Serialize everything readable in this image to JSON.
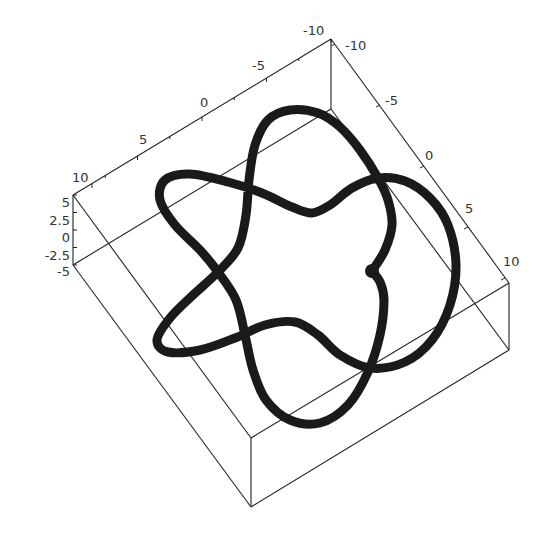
{
  "chart_data": {
    "type": "line",
    "subtype": "3d-parametric-curve",
    "title": "",
    "axes": {
      "x": {
        "range": [
          -10,
          10
        ],
        "ticks": [
          "10",
          "5",
          "0",
          "-5",
          "-10"
        ]
      },
      "y": {
        "range": [
          -10,
          10
        ],
        "ticks": [
          "-10",
          "-5",
          "0",
          "5",
          "10"
        ]
      },
      "z": {
        "range": [
          -5,
          5
        ],
        "ticks": [
          "5",
          "2.5",
          "0",
          "-2.5",
          "-5"
        ]
      }
    },
    "box_grid": false,
    "legend": null,
    "curve_points_2d_projection": [
      [
        372,
        271
      ],
      [
        385,
        250
      ],
      [
        392,
        225
      ],
      [
        388,
        200
      ],
      [
        378,
        178
      ],
      [
        360,
        150
      ],
      [
        340,
        127
      ],
      [
        318,
        113
      ],
      [
        290,
        110
      ],
      [
        268,
        120
      ],
      [
        255,
        145
      ],
      [
        249,
        180
      ],
      [
        246,
        215
      ],
      [
        238,
        248
      ],
      [
        218,
        272
      ],
      [
        193,
        295
      ],
      [
        170,
        318
      ],
      [
        157,
        340
      ],
      [
        168,
        352
      ],
      [
        200,
        350
      ],
      [
        235,
        338
      ],
      [
        265,
        325
      ],
      [
        295,
        322
      ],
      [
        318,
        335
      ],
      [
        340,
        355
      ],
      [
        370,
        368
      ],
      [
        405,
        362
      ],
      [
        432,
        340
      ],
      [
        450,
        305
      ],
      [
        456,
        265
      ],
      [
        448,
        225
      ],
      [
        430,
        198
      ],
      [
        405,
        181
      ],
      [
        378,
        178
      ],
      [
        352,
        188
      ],
      [
        330,
        205
      ],
      [
        312,
        213
      ],
      [
        292,
        207
      ],
      [
        262,
        193
      ],
      [
        228,
        182
      ],
      [
        190,
        174
      ],
      [
        165,
        180
      ],
      [
        160,
        200
      ],
      [
        175,
        225
      ],
      [
        200,
        250
      ],
      [
        218,
        272
      ],
      [
        236,
        300
      ],
      [
        245,
        335
      ],
      [
        253,
        370
      ],
      [
        266,
        400
      ],
      [
        290,
        420
      ],
      [
        320,
        423
      ],
      [
        348,
        405
      ],
      [
        368,
        372
      ],
      [
        380,
        335
      ],
      [
        384,
        300
      ],
      [
        380,
        282
      ],
      [
        372,
        271
      ]
    ],
    "endpoint_marker": [
      372,
      271
    ]
  },
  "plot": {
    "tick_labels": {
      "top_left_axis": [
        "10",
        "5",
        "0",
        "-5",
        "-10"
      ],
      "top_right_axis": [
        "-10",
        "-5",
        "0",
        "5",
        "10"
      ],
      "vertical_axis": [
        "5",
        "2.5",
        "0",
        "-2.5",
        "-5"
      ]
    },
    "colors": {
      "curve": "#1a1a1a",
      "box": "#222222",
      "background": "#ffffff"
    }
  }
}
